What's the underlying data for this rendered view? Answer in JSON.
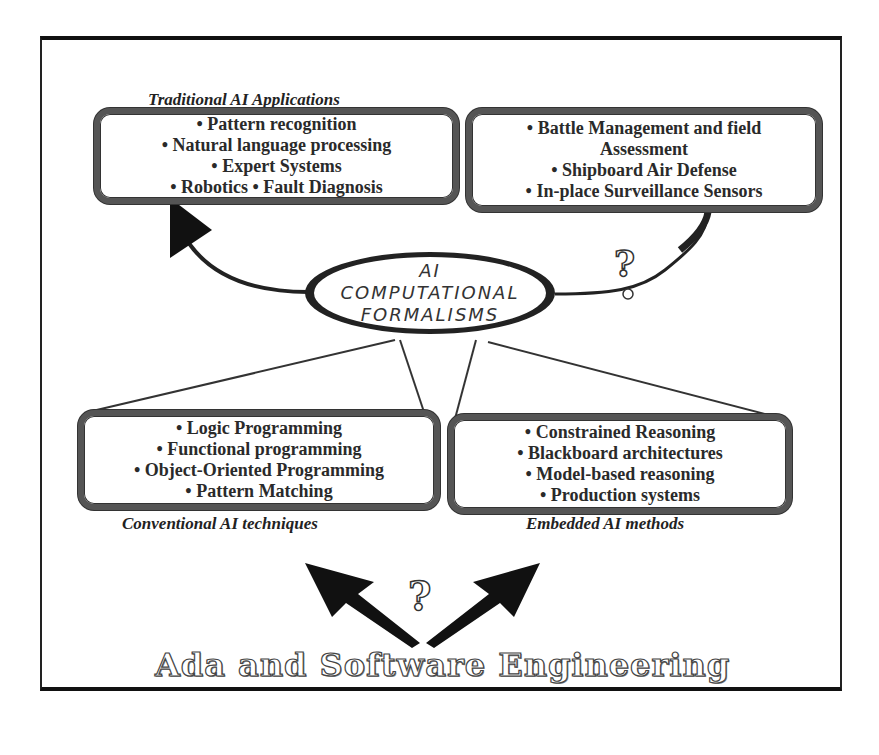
{
  "diagram": {
    "center": {
      "lines": [
        "AI",
        "COMPUTATIONAL",
        "FORMALISMS"
      ]
    },
    "top_left": {
      "title": "Traditional AI Applications",
      "items": [
        "• Pattern recognition",
        "• Natural language processing",
        "• Expert Systems",
        "• Robotics  • Fault Diagnosis"
      ]
    },
    "top_right": {
      "title": "Embedded AI Applications",
      "items": [
        "• Battle Management and field",
        "Assessment",
        "• Shipboard Air Defense",
        "• In-place Surveillance Sensors"
      ]
    },
    "bottom_left": {
      "title": "Conventional AI techniques",
      "items": [
        "• Logic Programming",
        "• Functional programming",
        "• Object-Oriented Programming",
        "• Pattern Matching"
      ]
    },
    "bottom_right": {
      "title": "Embedded AI methods",
      "items": [
        "• Constrained Reasoning",
        "• Blackboard architectures",
        "• Model-based reasoning",
        "• Production systems"
      ]
    },
    "question_marks": [
      "?",
      "?"
    ],
    "bottom_title": "Ada and Software Engineering"
  }
}
